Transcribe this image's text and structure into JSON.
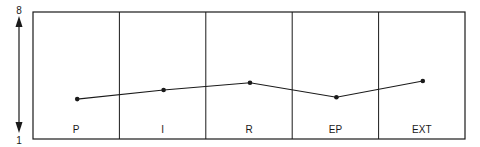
{
  "chart_data": {
    "type": "line",
    "title": "",
    "xlabel": "",
    "ylabel": "",
    "categories": [
      "P",
      "I",
      "R",
      "EP",
      "EXT"
    ],
    "series": [
      {
        "name": "profile",
        "values": [
          3.2,
          3.7,
          4.1,
          3.3,
          4.2
        ]
      }
    ],
    "ylim": [
      1,
      8
    ],
    "y_axis_labels": {
      "top": "8",
      "bottom": "1"
    },
    "y_axis_style": "double-headed arrow",
    "grid": false,
    "legend": null,
    "colors": {
      "line": "#1a1a1a",
      "border": "#1a1a1a",
      "background": "#ffffff"
    }
  }
}
